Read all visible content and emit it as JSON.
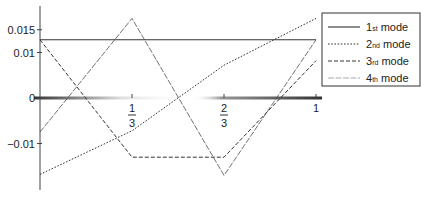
{
  "chart_data": {
    "type": "line",
    "title": "",
    "xlabel": "",
    "ylabel": "",
    "xlim": [
      0,
      1
    ],
    "ylim": [
      -0.021,
      0.02
    ],
    "x_ticks": [
      {
        "value": 0.3333,
        "num": "1",
        "den": "3"
      },
      {
        "value": 0.6667,
        "num": "2",
        "den": "3"
      },
      {
        "value": 1,
        "label": "1"
      }
    ],
    "y_ticks": [
      {
        "value": 0.015,
        "label": "0.015"
      },
      {
        "value": 0.01,
        "label": "0.01"
      },
      {
        "value": 0,
        "label": "0"
      },
      {
        "value": -0.01,
        "label": "-0.01"
      }
    ],
    "grid": false,
    "legend_position": "upper right",
    "x": [
      0,
      0.3333,
      0.6667,
      1
    ],
    "series": [
      {
        "name": "1st mode",
        "base": "1",
        "sup": "st",
        "rest": " mode",
        "style": "solid",
        "values": [
          0.0128,
          0.0128,
          0.0128,
          0.0128
        ]
      },
      {
        "name": "2nd mode",
        "base": "2",
        "sup": "nd",
        "rest": " mode",
        "style": "dotted",
        "values": [
          -0.0168,
          -0.0072,
          0.0072,
          0.0175
        ]
      },
      {
        "name": "3rd mode",
        "base": "3",
        "sup": "rd",
        "rest": " mode",
        "style": "dashed",
        "values": [
          0.0128,
          -0.013,
          -0.013,
          0.0082
        ]
      },
      {
        "name": "4th mode",
        "base": "4",
        "sup": "th",
        "rest": " mode",
        "style": "faint",
        "values": [
          -0.0075,
          0.0175,
          -0.017,
          0.0128
        ]
      }
    ]
  }
}
